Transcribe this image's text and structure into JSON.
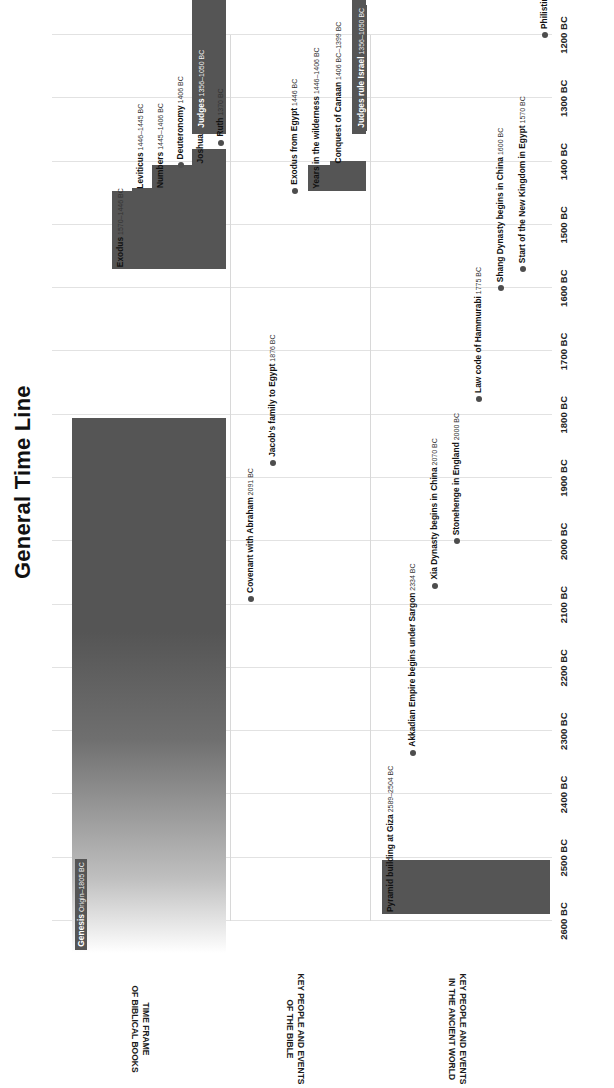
{
  "chart_data": {
    "type": "timeline",
    "title": "General Time Line",
    "xlabel": "",
    "ylabel": "",
    "xlim": [
      -2600,
      -1200
    ],
    "x_tick_labels": [
      "2600 BC",
      "2500 BC",
      "2400 BC",
      "2300 BC",
      "2200 BC",
      "2100 BC",
      "2000 BC",
      "1900 BC",
      "1800 BC",
      "1700 BC",
      "1600 BC",
      "1500 BC",
      "1400 BC",
      "1300 BC",
      "1200 BC"
    ],
    "x_tick_values": [
      -2600,
      -2500,
      -2400,
      -2300,
      -2200,
      -2100,
      -2000,
      -1900,
      -1800,
      -1700,
      -1600,
      -1500,
      -1400,
      -1300,
      -1200
    ],
    "grid": true,
    "legend": "none",
    "lanes": [
      {
        "id": "time-frame-of-biblical-books",
        "label": "TIME FRAME\nOF BIBLICAL BOOKS",
        "items": [
          {
            "name": "Genesis",
            "range": "Origin–1805 BC",
            "kind": "bar",
            "start": -2650,
            "end": -1805,
            "fade_start": true,
            "label_on_bar": true
          },
          {
            "name": "Exodus",
            "range": "1570–1446 BC",
            "kind": "bar",
            "start": -1570,
            "end": -1446,
            "fade_start": false,
            "label_on_bar": false
          },
          {
            "name": "Leviticus",
            "range": "1446–1445 BC",
            "kind": "bar",
            "start": -1446,
            "end": -1445,
            "fade_start": false,
            "label_on_bar": false
          },
          {
            "name": "Numbers",
            "range": "1445–1406 BC",
            "kind": "bar",
            "start": -1445,
            "end": -1406,
            "fade_start": false,
            "label_on_bar": false
          },
          {
            "name": "Deuteronomy",
            "range": "1406 BC",
            "kind": "dot",
            "start": -1406,
            "end": -1406,
            "fade_start": false,
            "label_on_bar": false
          },
          {
            "name": "Joshua",
            "range": "1406–1380 BC",
            "kind": "bar",
            "start": -1406,
            "end": -1380,
            "fade_start": false,
            "label_on_bar": false
          },
          {
            "name": "Judges",
            "range": "1356–1050 BC",
            "kind": "bar",
            "start": -1356,
            "end": -1050,
            "fade_start": false,
            "label_on_bar": true
          },
          {
            "name": "Ruth",
            "range": "1370 BC",
            "kind": "dot",
            "start": -1370,
            "end": -1370,
            "fade_start": false,
            "label_on_bar": false
          }
        ]
      },
      {
        "id": "key-people-and-events-of-the-bible",
        "label": "KEY PEOPLE AND EVENTS\nOF THE BIBLE",
        "items": [
          {
            "name": "Covenant with Abraham",
            "range": "2091 BC",
            "kind": "dot",
            "start": -2091,
            "end": -2091,
            "fade_start": false,
            "label_on_bar": false
          },
          {
            "name": "Jacob's family to Egypt",
            "range": "1876 BC",
            "kind": "dot",
            "start": -1876,
            "end": -1876,
            "fade_start": false,
            "label_on_bar": false
          },
          {
            "name": "Exodus from Egypt",
            "range": "1446 BC",
            "kind": "dot",
            "start": -1446,
            "end": -1446,
            "fade_start": false,
            "label_on_bar": false
          },
          {
            "name": "Years in the wilderness",
            "range": "1446–1406 BC",
            "kind": "bar",
            "start": -1446,
            "end": -1406,
            "fade_start": false,
            "label_on_bar": false
          },
          {
            "name": "Conquest of Canaan",
            "range": "1406 BC–1399 BC",
            "kind": "bar",
            "start": -1406,
            "end": -1399,
            "fade_start": false,
            "label_on_bar": false
          },
          {
            "name": "Judges rule Israel",
            "range": "1356–1050 BC",
            "kind": "bar",
            "start": -1356,
            "end": -1050,
            "fade_start": false,
            "label_on_bar": true
          }
        ]
      },
      {
        "id": "key-people-and-events-in-the-ancient-world",
        "label": "KEY PEOPLE AND EVENTS\nIN THE ANCIENT WORLD",
        "items": [
          {
            "name": "Pyramid building at Giza",
            "range": "2589–2504 BC",
            "kind": "bar",
            "start": -2589,
            "end": -2504,
            "fade_start": false,
            "label_on_bar": false
          },
          {
            "name": "Akkadian Empire begins under Sargon",
            "range": "2334 BC",
            "kind": "dot",
            "start": -2334,
            "end": -2334,
            "fade_start": false,
            "label_on_bar": false
          },
          {
            "name": "Xia Dynasty begins in China",
            "range": "2070 BC",
            "kind": "dot",
            "start": -2070,
            "end": -2070,
            "fade_start": false,
            "label_on_bar": false
          },
          {
            "name": "Stonehenge in England",
            "range": "2000 BC",
            "kind": "dot",
            "start": -2000,
            "end": -2000,
            "fade_start": false,
            "label_on_bar": false
          },
          {
            "name": "Law code of Hammurabi",
            "range": "1775 BC",
            "kind": "dot",
            "start": -1775,
            "end": -1775,
            "fade_start": false,
            "label_on_bar": false
          },
          {
            "name": "Shang Dynasty begins in China",
            "range": "1600 BC",
            "kind": "dot",
            "start": -1600,
            "end": -1600,
            "fade_start": false,
            "label_on_bar": false
          },
          {
            "name": "Start of the New Kingdom in Egypt",
            "range": "1570 BC",
            "kind": "dot",
            "start": -1570,
            "end": -1570,
            "fade_start": false,
            "label_on_bar": false
          },
          {
            "name": "Philistines arrive in SW Canaan",
            "range": "1200 BC",
            "kind": "dot",
            "start": -1200,
            "end": -1200,
            "fade_start": false,
            "label_on_bar": false
          }
        ]
      }
    ]
  },
  "colors": {
    "bar": "#555555",
    "dot": "#4d4d4d",
    "grid": "#e2e2e2",
    "text": "#111111",
    "background": "#ffffff"
  }
}
